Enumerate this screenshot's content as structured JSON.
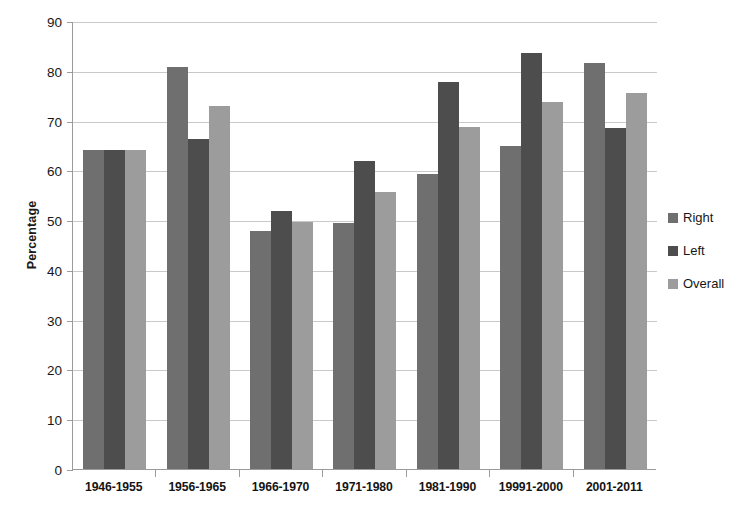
{
  "chart_data": {
    "type": "bar",
    "title": "",
    "xlabel": "",
    "ylabel": "Percentage",
    "ylim": [
      0,
      90
    ],
    "ytick_step": 10,
    "yticks": [
      90,
      80,
      70,
      60,
      50,
      40,
      30,
      20,
      10,
      0
    ],
    "grid": true,
    "legend_position": "right",
    "categories": [
      "1946-1955",
      "1956-1965",
      "1966-1970",
      "1971-1980",
      "1981-1990",
      "19991-2000",
      "2001-2011"
    ],
    "series": [
      {
        "name": "Right",
        "color": "#6f6f6f",
        "values": [
          64.0,
          80.8,
          47.8,
          49.5,
          59.2,
          64.8,
          81.6
        ]
      },
      {
        "name": "Left",
        "color": "#4d4d4d",
        "values": [
          64.0,
          66.2,
          51.9,
          61.8,
          77.8,
          83.6,
          68.6
        ]
      },
      {
        "name": "Overall",
        "color": "#9c9c9c",
        "values": [
          64.0,
          72.9,
          49.7,
          55.6,
          68.7,
          73.7,
          75.5
        ]
      }
    ]
  },
  "axis_colors": {
    "axis_line": "#9b9b9b",
    "gridline": "#c9c9c9",
    "text": "#171717"
  }
}
